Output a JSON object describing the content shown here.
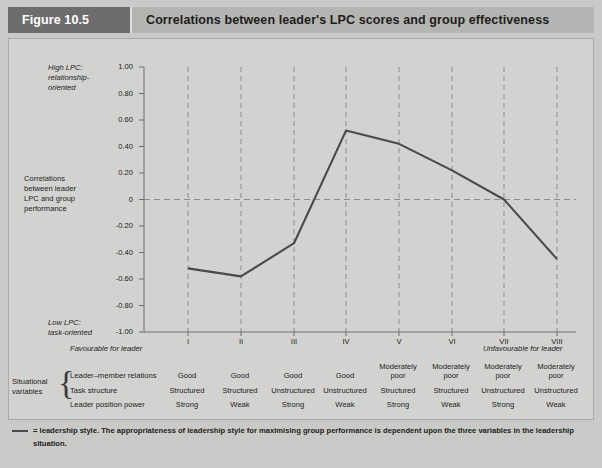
{
  "header": {
    "figure_number": "Figure 10.5",
    "title": "Correlations between leader's LPC scores and group effectiveness"
  },
  "axis": {
    "y_top_note_line1": "High LPC:",
    "y_top_note_line2": "relationship-",
    "y_top_note_line3": "oriented",
    "y_bottom_note_line1": "Low LPC:",
    "y_bottom_note_line2": "task-oriented",
    "y_title_line1": "Correlations",
    "y_title_line2": "between leader",
    "y_title_line3": "LPC and group",
    "y_title_line4": "performance",
    "x_left_note": "Favourable for leader",
    "x_right_note": "Unfavourable for leader"
  },
  "chart_data": {
    "type": "line",
    "title": "Correlations between leader's LPC scores and group effectiveness",
    "xlabel": "",
    "ylabel": "Correlations between leader LPC and group performance",
    "categories": [
      "I",
      "II",
      "III",
      "IV",
      "V",
      "VI",
      "VII",
      "VIII"
    ],
    "values": [
      -0.52,
      -0.58,
      -0.33,
      0.52,
      0.42,
      0.22,
      0.0,
      -0.45
    ],
    "series": [
      {
        "name": "leadership style",
        "values": [
          -0.52,
          -0.58,
          -0.33,
          0.52,
          0.42,
          0.22,
          0.0,
          -0.45
        ]
      }
    ],
    "ylim": [
      -1.0,
      1.0
    ],
    "ytick_labels": [
      "1.00",
      "0.80",
      "0.60",
      "0.40",
      "0.20",
      "0",
      "-0.20",
      "-0.40",
      "-0.60",
      "-0.80",
      "-1.00"
    ],
    "ytick_values": [
      1.0,
      0.8,
      0.6,
      0.4,
      0.2,
      0,
      -0.2,
      -0.4,
      -0.6,
      -0.8,
      -1.0
    ],
    "grid": "vertical dashed gridlines at each category plus dashed horizontal zero line",
    "legend": "= leadership style",
    "line_color": "#4a4a4a",
    "plot_background": "#d2d2d0"
  },
  "table": {
    "group_label_line1": "Situational",
    "group_label_line2": "variables",
    "row_labels": [
      "Leader–member relations",
      "Task structure",
      "Leader position power"
    ],
    "columns": [
      "I",
      "II",
      "III",
      "IV",
      "V",
      "VI",
      "VII",
      "VIII"
    ],
    "rows": [
      [
        "Good",
        "Good",
        "Good",
        "Good",
        "Moderately\npoor",
        "Moderately\npoor",
        "Moderately\npoor",
        "Moderately\npoor"
      ],
      [
        "Structured",
        "Structured",
        "Unstructured",
        "Unstructured",
        "Structured",
        "Structured",
        "Unstructured",
        "Unstructured"
      ],
      [
        "Strong",
        "Weak",
        "Strong",
        "Weak",
        "Strong",
        "Weak",
        "Strong",
        "Weak"
      ]
    ]
  },
  "footnote": {
    "legend_symbol": "—",
    "text": "= leadership style.   The appropriateness of leadership style for maximising group performance is dependent upon the three variables in the leadership situation."
  },
  "colors": {
    "page_background": "#c9c9c7",
    "panel_background": "#d2d2d0",
    "header_badge": "#6d6d6d",
    "header_bar": "#b4b4b2",
    "line": "#4a4a4a",
    "grid": "#8d8d8b",
    "text": "#1d1d1d"
  }
}
